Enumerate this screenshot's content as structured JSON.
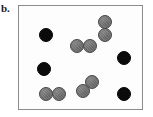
{
  "panel": {
    "label": "b.",
    "box": {
      "x": 18,
      "y": 5,
      "width": 125,
      "height": 105,
      "border_color": "#8c8c8c",
      "fill_color": "#fdfdfd"
    }
  },
  "legend_colors": {
    "monomer_black": "#0b0b0b",
    "dimer_gray": "#6f6f6f",
    "gray_outline": "#4a4a4a",
    "background": "#ffffff"
  },
  "chart_data": {
    "type": "scatter",
    "title": "b.",
    "xlabel": "",
    "ylabel": "",
    "xlim": [
      0,
      125
    ],
    "ylim": [
      0,
      105
    ],
    "grid": false,
    "legend": "none",
    "annotations": [
      "4 isolated black particles",
      "4 touching gray particle pairs"
    ],
    "series": [
      {
        "name": "black-monomer",
        "color": "#0b0b0b",
        "marker": "circle",
        "radius": 7,
        "points": [
          {
            "x": 27,
            "y": 29
          },
          {
            "x": 25,
            "y": 63
          },
          {
            "x": 105,
            "y": 52
          },
          {
            "x": 105,
            "y": 88
          }
        ]
      },
      {
        "name": "gray-dimer",
        "color": "#6f6f6f",
        "marker": "circle",
        "radius": 7,
        "points": [
          {
            "x": 86,
            "y": 16
          },
          {
            "x": 86,
            "y": 29
          },
          {
            "x": 58,
            "y": 40
          },
          {
            "x": 71,
            "y": 40
          },
          {
            "x": 27,
            "y": 88
          },
          {
            "x": 40,
            "y": 88
          },
          {
            "x": 73,
            "y": 76
          },
          {
            "x": 64,
            "y": 85
          }
        ]
      }
    ]
  }
}
